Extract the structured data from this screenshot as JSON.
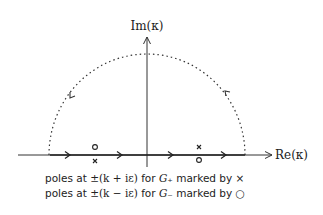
{
  "diagram": {
    "type": "complex-plane contour",
    "axes": {
      "x_label": "Re(κ)",
      "y_label": "Im(κ)"
    },
    "contour": {
      "description": "real axis from -R to R closed by upper semicircle (dotted), counter-clockwise",
      "real_axis_arrows": 4,
      "arc_arrows": 2
    },
    "poles": [
      {
        "marker": "o",
        "position": "left, above axis",
        "family": "G-"
      },
      {
        "marker": "×",
        "position": "left, below axis",
        "family": "G+"
      },
      {
        "marker": "×",
        "position": "right, above axis",
        "family": "G+"
      },
      {
        "marker": "o",
        "position": "right, below axis",
        "family": "G-"
      }
    ],
    "colors": {
      "line": "#333333",
      "background": "#ffffff"
    }
  },
  "caption": {
    "line1": {
      "prefix": "poles at ",
      "expr": "±(k + iε)",
      "mid": " for ",
      "func": "G₊",
      "suffix": " marked by ×"
    },
    "line2": {
      "prefix": "poles at ",
      "expr": "±(k − iε)",
      "mid": " for ",
      "func": "G₋",
      "suffix": " marked by ○"
    }
  }
}
